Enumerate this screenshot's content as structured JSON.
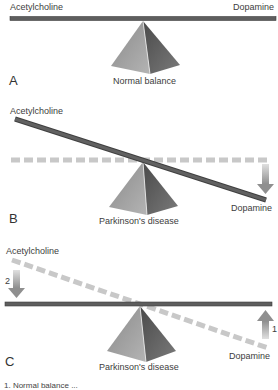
{
  "figure": {
    "panels": [
      {
        "letter": "A",
        "left_label": "Acetylcholine",
        "right_label": "Dopamine",
        "caption": "Normal balance"
      },
      {
        "letter": "B",
        "left_label": "Acetylcholine",
        "right_label": "Dopamine",
        "caption": "Parkinson's disease"
      },
      {
        "letter": "C",
        "left_label": "Acetylcholine",
        "right_label": "Dopamine",
        "caption": "Parkinson's disease",
        "arrow_labels": {
          "left": "2",
          "right": "1"
        }
      }
    ],
    "footer_text": "1. Normal balance ...",
    "colors": {
      "bar": "#5e5e5e",
      "bar_edge": "#3f3f3f",
      "dashed": "#c8c8c8",
      "arrow": "#a9a9a9",
      "pyramid_light": "#9a9a9a",
      "pyramid_dark": "#555555"
    }
  }
}
